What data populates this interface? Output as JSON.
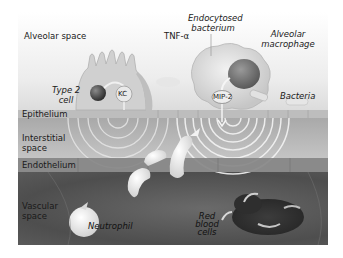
{
  "figure": {
    "regions": {
      "alveolar_space": "Alveolar space",
      "epithelium": "Epithelium",
      "interstitial_space_line1": "Interstitial",
      "interstitial_space_line2": "space",
      "endothelium": "Endothelium",
      "vascular_space_line1": "Vascular",
      "vascular_space_line2": "space"
    },
    "labels": {
      "tnf_alpha": "TNF-α",
      "endocytosed_bacterium_line1": "Endocytosed",
      "endocytosed_bacterium_line2": "bacterium",
      "alveolar_macrophage_line1": "Alveolar",
      "alveolar_macrophage_line2": "macrophage",
      "type2_cell_line1": "Type 2",
      "type2_cell_line2": "cell",
      "kc": "KC",
      "mip2": "MIP-2",
      "bacteria": "Bacteria",
      "neutrophil": "Neutrophil",
      "red_blood_cells_line1": "Red",
      "red_blood_cells_line2": "blood",
      "red_blood_cells_line3": "cells"
    }
  }
}
